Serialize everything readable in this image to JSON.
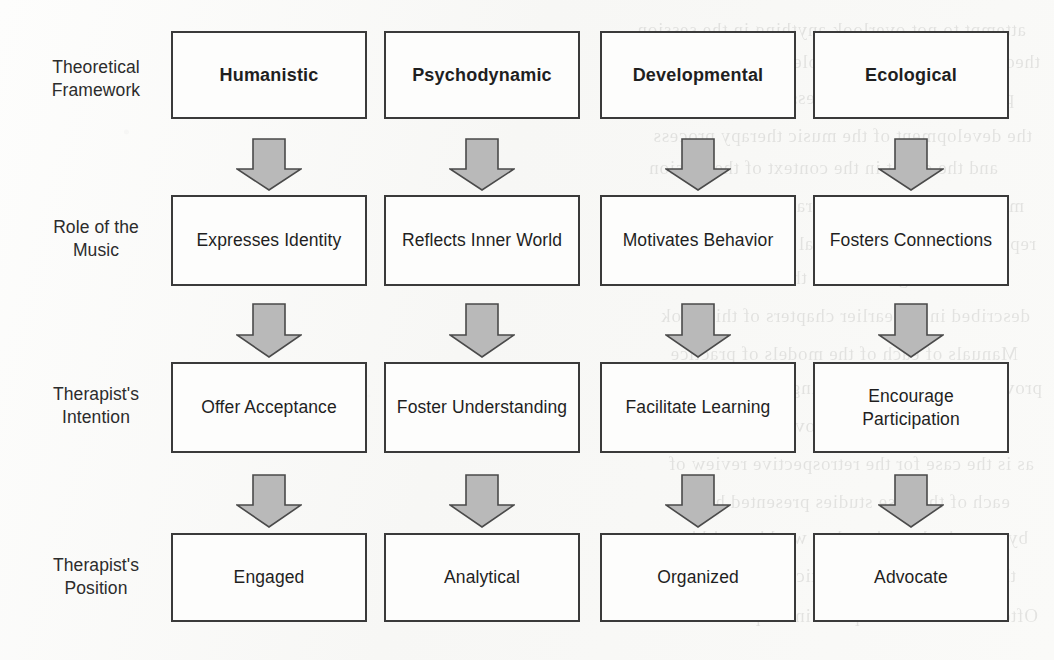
{
  "figure": {
    "type": "flowchart-matrix",
    "columns": 4,
    "rows": 4,
    "connector": "down-arrow",
    "colors": {
      "box_border": "#3a3a3a",
      "box_fill": "#fdfdfc",
      "arrow_fill": "#b9b9b9",
      "arrow_stroke": "#4a4a4a",
      "text": "#1f1f1f",
      "page_background": "#fbfbfa"
    }
  },
  "row_labels": [
    {
      "line1": "Theoretical",
      "line2": "Framework"
    },
    {
      "line1": "Role of the",
      "line2": "Music"
    },
    {
      "line1": "Therapist's",
      "line2": "Intention"
    },
    {
      "line1": "Therapist's",
      "line2": "Position"
    }
  ],
  "columns": [
    {
      "framework": "Humanistic",
      "role_of_the_music": "Expresses Identity",
      "therapists_intention": "Offer Acceptance",
      "therapists_position": "Engaged"
    },
    {
      "framework": "Psychodynamic",
      "role_of_the_music": "Reflects Inner World",
      "therapists_intention": "Foster Understanding",
      "therapists_position": "Analytical"
    },
    {
      "framework": "Developmental",
      "role_of_the_music": "Motivates Behavior",
      "therapists_intention": "Facilitate Learning",
      "therapists_position": "Organized"
    },
    {
      "framework": "Ecological",
      "role_of_the_music": "Fosters Connections",
      "therapists_intention": "Encourage Participation",
      "therapists_position": "Advocate"
    }
  ],
  "ghost_text": {
    "note": "faint mirrored bleed-through from the reverse side of the scanned page",
    "lines": [
      "attempt to not overlook anything in the session",
      "theoretically across the whole of the therapeutic",
      "process across the few sessions known to the",
      "the development of the music therapy process",
      "and the client in the context of the session",
      "music therapy theory in practice and the",
      "representation of the clinical work undertaken",
      "is a recurring feature of the written record",
      "described in the earlier chapters of this book",
      "Manuals of each of the models of practice",
      "provide for the therapist being a presence",
      "assessment of the improvisation at a later point",
      "as is the case for the retrospective review of",
      "each of the case studies presented here",
      "by a music therapist when working within",
      "the approach in the practice setting",
      "Often the work takes place in hospital"
    ]
  }
}
